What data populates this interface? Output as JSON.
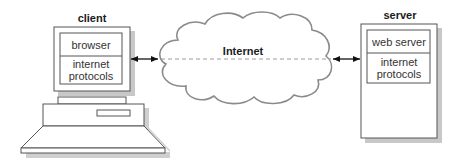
{
  "client": {
    "title": "client",
    "layers": [
      "browser",
      "internet",
      "protocols"
    ]
  },
  "server": {
    "title": "server",
    "layers": [
      "web server",
      "internet",
      "protocols"
    ]
  },
  "network": {
    "label": "Internet"
  },
  "colors": {
    "line": "#555555",
    "shadow": "#c8c8c8",
    "cloud": "#8a8a8a",
    "dash": "#9a9a9a",
    "arrow": "#111111"
  }
}
